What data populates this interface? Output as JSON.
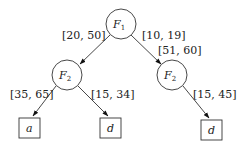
{
  "diagram": {
    "type": "decision-tree",
    "nodes": [
      {
        "id": "root",
        "kind": "feature",
        "var": "F",
        "sub": "1"
      },
      {
        "id": "left",
        "kind": "feature",
        "var": "F",
        "sub": "2"
      },
      {
        "id": "right",
        "kind": "feature",
        "var": "F",
        "sub": "2"
      },
      {
        "id": "leaf1",
        "kind": "leaf",
        "label": "a"
      },
      {
        "id": "leaf2",
        "kind": "leaf",
        "label": "d"
      },
      {
        "id": "leaf3",
        "kind": "leaf",
        "label": "d"
      }
    ],
    "edges": [
      {
        "from": "root",
        "to": "left",
        "label": "[20, 50]"
      },
      {
        "from": "root",
        "to": "right",
        "label": "[10, 19]",
        "label2": "[51, 60]"
      },
      {
        "from": "left",
        "to": "leaf1",
        "label": "[35, 65]"
      },
      {
        "from": "left",
        "to": "leaf2",
        "label": "[15, 34]"
      },
      {
        "from": "right",
        "to": "leaf3",
        "label": "[15, 45]"
      }
    ]
  }
}
